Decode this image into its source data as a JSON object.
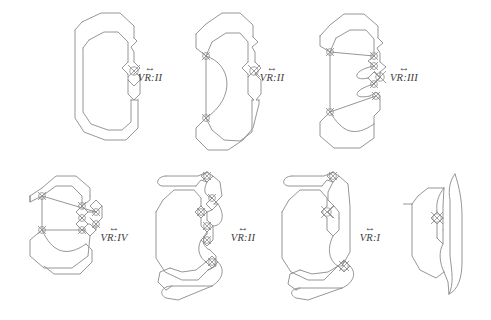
{
  "figure": {
    "background_color": "#ffffff",
    "stroke_color": "#8a8a8a",
    "label_color": "#3b3b3b",
    "width": 491,
    "height": 320
  },
  "moves": [
    {
      "id": "move-1",
      "arrow": "↔",
      "label": "VR:II",
      "x": 150,
      "y": 74,
      "row": "top",
      "between": [
        "diagram-1",
        "diagram-2"
      ]
    },
    {
      "id": "move-2",
      "arrow": "↔",
      "label": "VR:II",
      "x": 272,
      "y": 74,
      "row": "top",
      "between": [
        "diagram-2",
        "diagram-3"
      ]
    },
    {
      "id": "move-3",
      "arrow": "↔",
      "label": "VR:III",
      "x": 403,
      "y": 74,
      "row": "top",
      "between": [
        "diagram-3",
        "diagram-4"
      ]
    },
    {
      "id": "move-4",
      "arrow": "↔",
      "label": "VR:IV",
      "x": 113,
      "y": 234,
      "row": "bottom",
      "between": [
        "diagram-4",
        "diagram-5"
      ]
    },
    {
      "id": "move-5",
      "arrow": "↔",
      "label": "VR:II",
      "x": 243,
      "y": 234,
      "row": "bottom",
      "between": [
        "diagram-5",
        "diagram-6"
      ]
    },
    {
      "id": "move-6",
      "arrow": "↔",
      "label": "VR:I",
      "x": 370,
      "y": 234,
      "row": "bottom",
      "between": [
        "diagram-6",
        "diagram-7"
      ]
    }
  ],
  "diagrams": [
    {
      "id": "diagram-1",
      "name": "virtual-knot-diagram-1",
      "row": "top",
      "order": 1,
      "crossings": 1
    },
    {
      "id": "diagram-2",
      "name": "virtual-knot-diagram-2",
      "row": "top",
      "order": 2,
      "crossings": 3
    },
    {
      "id": "diagram-3",
      "name": "virtual-knot-diagram-3",
      "row": "top",
      "order": 3,
      "crossings": 7
    },
    {
      "id": "diagram-4",
      "name": "virtual-knot-diagram-4",
      "row": "bottom",
      "order": 4,
      "crossings": 7
    },
    {
      "id": "diagram-5",
      "name": "virtual-knot-diagram-5",
      "row": "bottom",
      "order": 5,
      "crossings": 6
    },
    {
      "id": "diagram-6",
      "name": "virtual-knot-diagram-6",
      "row": "bottom",
      "order": 6,
      "crossings": 2
    },
    {
      "id": "diagram-7",
      "name": "virtual-knot-diagram-7",
      "row": "bottom",
      "order": 7,
      "crossings": 1
    }
  ]
}
